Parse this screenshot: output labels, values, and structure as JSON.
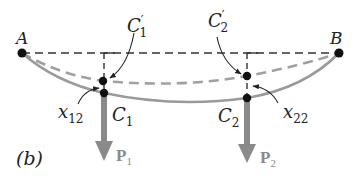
{
  "figure": {
    "panel_label": "(b)",
    "points": {
      "A": {
        "label": "A"
      },
      "B": {
        "label": "B"
      },
      "C1": {
        "label": "C",
        "sub": "1"
      },
      "C2": {
        "label": "C",
        "sub": "2"
      },
      "C1_prime": {
        "label": "C",
        "sup": "′",
        "sub": "1"
      },
      "C2_prime": {
        "label": "C",
        "sup": "′",
        "sub": "2"
      }
    },
    "deflections": {
      "x12": {
        "label": "x",
        "sub": "12"
      },
      "x22": {
        "label": "x",
        "sub": "22"
      }
    },
    "loads": {
      "P1": {
        "label": "P",
        "sub": "1"
      },
      "P2": {
        "label": "P",
        "sub": "2"
      }
    },
    "colors": {
      "reference_line": "#333333",
      "deflected_curve": "#9a9a9a",
      "load_arrow": "#8a8a8a",
      "points": "#111111"
    }
  }
}
